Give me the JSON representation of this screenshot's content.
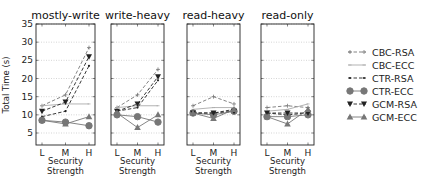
{
  "chart_data": {
    "type": "line",
    "ylabel": "Total Time (s)",
    "xlabel": "Security Strength",
    "ylim": [
      1.7,
      35
    ],
    "yticks": [
      5,
      10,
      15,
      20,
      25,
      30,
      35
    ],
    "categories": [
      "L",
      "M",
      "H"
    ],
    "grid": "horizontal dotted",
    "legend_position": "right",
    "legend": [
      {
        "name": "CBC-RSA",
        "style": "dashed",
        "color": "#777777",
        "marker": "plus"
      },
      {
        "name": "CBC-ECC",
        "style": "solid",
        "color": "#aaaaaa",
        "marker": "tick"
      },
      {
        "name": "CTR-RSA",
        "style": "dashed",
        "color": "#222222",
        "marker": "dot"
      },
      {
        "name": "CTR-ECC",
        "style": "solid",
        "color": "#777777",
        "marker": "circle"
      },
      {
        "name": "GCM-RSA",
        "style": "dashed",
        "color": "#222222",
        "marker": "triangle-down"
      },
      {
        "name": "GCM-ECC",
        "style": "solid",
        "color": "#777777",
        "marker": "triangle-up"
      }
    ],
    "panels": [
      {
        "title": "mostly-write",
        "series": [
          {
            "name": "CBC-RSA",
            "values": [
              12.5,
              15.5,
              28.5
            ]
          },
          {
            "name": "CBC-ECC",
            "values": [
              12.5,
              13,
              13
            ]
          },
          {
            "name": "CTR-RSA",
            "values": [
              9.5,
              11,
              23.5
            ]
          },
          {
            "name": "CTR-ECC",
            "values": [
              8.5,
              8,
              7
            ]
          },
          {
            "name": "GCM-RSA",
            "values": [
              11,
              13.5,
              26
            ]
          },
          {
            "name": "GCM-ECC",
            "values": [
              8.5,
              7.5,
              9.5
            ]
          }
        ]
      },
      {
        "title": "write-heavy",
        "series": [
          {
            "name": "CBC-RSA",
            "values": [
              12,
              15.5,
              22.5
            ]
          },
          {
            "name": "CBC-ECC",
            "values": [
              12,
              12.5,
              12.5
            ]
          },
          {
            "name": "CTR-RSA",
            "values": [
              11,
              12,
              19.5
            ]
          },
          {
            "name": "CTR-ECC",
            "values": [
              10,
              9.5,
              8
            ]
          },
          {
            "name": "GCM-RSA",
            "values": [
              11,
              13,
              20.5
            ]
          },
          {
            "name": "GCM-ECC",
            "values": [
              10.5,
              6.5,
              10
            ]
          }
        ]
      },
      {
        "title": "read-heavy",
        "series": [
          {
            "name": "CBC-RSA",
            "values": [
              12.5,
              15,
              13
            ]
          },
          {
            "name": "CBC-ECC",
            "values": [
              11.5,
              12,
              12
            ]
          },
          {
            "name": "CTR-RSA",
            "values": [
              10.5,
              10.5,
              11.5
            ]
          },
          {
            "name": "CTR-ECC",
            "values": [
              10.5,
              10,
              11
            ]
          },
          {
            "name": "GCM-RSA",
            "values": [
              10.5,
              10.5,
              11
            ]
          },
          {
            "name": "GCM-ECC",
            "values": [
              10.5,
              9,
              11.5
            ]
          }
        ]
      },
      {
        "title": "read-only",
        "series": [
          {
            "name": "CBC-RSA",
            "values": [
              12,
              12.5,
              12
            ]
          },
          {
            "name": "CBC-ECC",
            "values": [
              11,
              11.5,
              13
            ]
          },
          {
            "name": "CTR-RSA",
            "values": [
              10.5,
              10,
              10.5
            ]
          },
          {
            "name": "CTR-ECC",
            "values": [
              9.5,
              9.5,
              10
            ]
          },
          {
            "name": "GCM-RSA",
            "values": [
              10.5,
              10.5,
              10.5
            ]
          },
          {
            "name": "GCM-ECC",
            "values": [
              9.5,
              7.5,
              11.5
            ]
          }
        ]
      }
    ]
  },
  "layout": {
    "plot_top": 24,
    "plot_bottom": 145,
    "panel_x": [
      [
        36,
        95
      ],
      [
        111,
        164
      ],
      [
        187,
        240
      ],
      [
        261,
        314
      ]
    ]
  }
}
